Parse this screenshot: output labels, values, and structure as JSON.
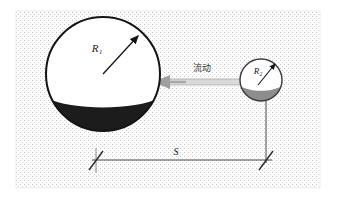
{
  "figure": {
    "background_color": "#ffffff",
    "panel": {
      "name": "stippled-panel",
      "x": 16,
      "y": 11,
      "width": 304,
      "height": 177,
      "fill": "#fdfdfd",
      "dot_color": "#c9c9c9",
      "border_color": "#e8e8e8"
    },
    "large_sphere": {
      "label": "R₁",
      "label_plain": "R1",
      "cx": 103,
      "cy": 74,
      "r": 57,
      "top_fill": "#ffffff",
      "bottom_fill": "#1c1c1c",
      "outline": "#141414",
      "fill_level_label": ""
    },
    "small_sphere": {
      "label": "R₂",
      "label_plain": "R2",
      "cx": 261,
      "cy": 80,
      "r": 21,
      "top_fill": "#ffffff",
      "bottom_fill": "#8d8d8d",
      "outline": "#3a3a3a"
    },
    "tube": {
      "label": "流动",
      "label_meaning": "flow",
      "x1": 160,
      "x2": 241,
      "y": 82,
      "thickness": 6,
      "fill": "#d9d9d9",
      "edge": "#9a9a9a",
      "arrow_direction": "left"
    },
    "dimension": {
      "label": "S",
      "y": 160,
      "x_left": 96,
      "x_right": 266,
      "line_color": "#4a4a4a",
      "tick_style": "cross",
      "extension_line_top": 101
    }
  },
  "colors": {
    "ink": "#1a1a1a",
    "dark_fill": "#1c1c1c",
    "gray_fill": "#8d8d8d",
    "tube_gray": "#d9d9d9",
    "dot_gray": "#c9c9c9",
    "line_gray": "#4a4a4a"
  }
}
